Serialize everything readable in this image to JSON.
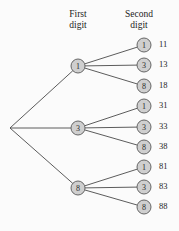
{
  "figure": {
    "background_color": "#fbfbfb",
    "edge_color": "#4a4a4a",
    "node_fill": "#cfcfcf",
    "node_stroke": "#585858",
    "text_color": "#1d1d1d"
  },
  "headings": {
    "first": {
      "line1": "First",
      "line2": "digit"
    },
    "second": {
      "line1": "Second",
      "line2": "digit"
    }
  },
  "chart_data": {
    "type": "tree",
    "root": {
      "label": "",
      "x": 10,
      "y": 128
    },
    "levels": [
      "First digit",
      "Second digit"
    ],
    "first_digits": [
      "1",
      "3",
      "8"
    ],
    "second_digits": [
      "1",
      "3",
      "8"
    ],
    "outcomes": [
      "11",
      "13",
      "18",
      "31",
      "33",
      "38",
      "81",
      "83",
      "88"
    ]
  },
  "nodes": {
    "level1": [
      {
        "label": "1",
        "x": 78,
        "y": 66
      },
      {
        "label": "3",
        "x": 78,
        "y": 128
      },
      {
        "label": "8",
        "x": 78,
        "y": 188
      }
    ],
    "level2": [
      {
        "label": "1",
        "x": 144,
        "y": 45,
        "outcome": "11"
      },
      {
        "label": "3",
        "x": 144,
        "y": 65,
        "outcome": "13"
      },
      {
        "label": "8",
        "x": 144,
        "y": 86,
        "outcome": "18"
      },
      {
        "label": "1",
        "x": 144,
        "y": 106,
        "outcome": "31"
      },
      {
        "label": "3",
        "x": 144,
        "y": 127,
        "outcome": "33"
      },
      {
        "label": "8",
        "x": 144,
        "y": 147,
        "outcome": "38"
      },
      {
        "label": "1",
        "x": 144,
        "y": 167,
        "outcome": "81"
      },
      {
        "label": "3",
        "x": 144,
        "y": 187,
        "outcome": "83"
      },
      {
        "label": "8",
        "x": 144,
        "y": 207,
        "outcome": "88"
      }
    ]
  },
  "outcome_label_x": 159
}
